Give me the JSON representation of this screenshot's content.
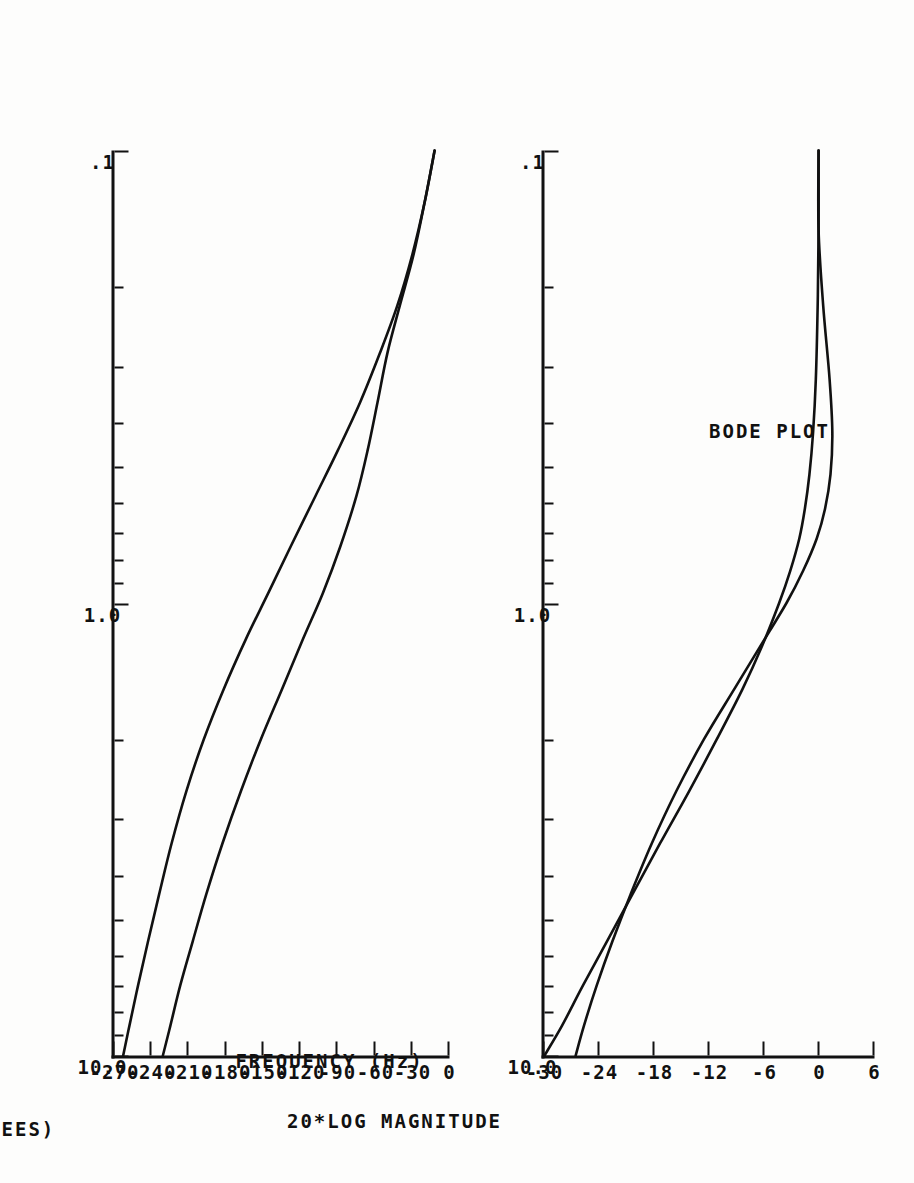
{
  "page": {
    "title": "BODE PLOT",
    "orientation": "rotated-90",
    "background": "#fdfdfc",
    "ink": "#111111"
  },
  "chart_data": [
    {
      "type": "line",
      "id": "magnitude",
      "title": "BODE PLOT",
      "xlabel": "",
      "ylabel": "20*LOG MAGNITUDE",
      "xscale": "log",
      "xlim": [
        0.1,
        10.0
      ],
      "ylim": [
        -30,
        6
      ],
      "xticks": [
        0.1,
        1.0,
        10.0
      ],
      "xticklabels": [
        ".1",
        "1.0",
        "10.0"
      ],
      "yticks": [
        6,
        0,
        -6,
        -12,
        -18,
        -24,
        -30
      ],
      "yticklabels": [
        "6",
        "0",
        "-6",
        "-12",
        "-18",
        "-24",
        "-30"
      ],
      "grid": false,
      "legend": "none",
      "series": [
        {
          "name": "curve-a",
          "x": [
            0.1,
            0.15,
            0.22,
            0.32,
            0.42,
            0.52,
            0.62,
            0.72,
            0.85,
            1.0,
            1.25,
            1.55,
            2.0,
            2.6,
            3.4,
            4.4,
            5.6,
            7.0,
            8.6,
            10.0
          ],
          "y": [
            -0.1,
            -0.1,
            -0.2,
            -0.4,
            -0.7,
            -1.1,
            -1.6,
            -2.2,
            -3.2,
            -4.4,
            -6.3,
            -8.4,
            -11.2,
            -14.2,
            -17.4,
            -20.4,
            -23.2,
            -25.8,
            -28.1,
            -30.0
          ]
        },
        {
          "name": "curve-b",
          "x": [
            0.1,
            0.15,
            0.22,
            0.32,
            0.42,
            0.52,
            0.62,
            0.72,
            0.85,
            1.0,
            1.25,
            1.55,
            2.0,
            2.6,
            3.4,
            4.4,
            5.6,
            7.0,
            8.6,
            10.0
          ],
          "y": [
            -0.1,
            -0.1,
            0.4,
            1.1,
            1.4,
            1.2,
            0.6,
            -0.3,
            -1.8,
            -3.6,
            -6.5,
            -9.3,
            -12.6,
            -15.6,
            -18.3,
            -20.6,
            -22.6,
            -24.3,
            -25.7,
            -26.6
          ]
        }
      ]
    },
    {
      "type": "line",
      "id": "phase",
      "title": "",
      "xlabel": "FREQUENCY  (Hz)",
      "ylabel": "PHASE (DEGREES)",
      "xscale": "log",
      "xlim": [
        0.1,
        10.0
      ],
      "ylim": [
        -270,
        0
      ],
      "xticks": [
        0.1,
        1.0,
        10.0
      ],
      "xticklabels": [
        ".1",
        "1.0",
        "10.0"
      ],
      "yticks": [
        0,
        -30,
        -60,
        -90,
        -120,
        -150,
        -180,
        -210,
        -240,
        -270
      ],
      "yticklabels": [
        "0",
        "-30",
        "-60",
        "-90",
        "-120",
        "-150",
        "-180",
        "-210",
        "-240",
        "-270"
      ],
      "grid": false,
      "legend": "none",
      "series": [
        {
          "name": "curve-a",
          "x": [
            0.1,
            0.13,
            0.17,
            0.22,
            0.28,
            0.36,
            0.46,
            0.58,
            0.75,
            0.95,
            1.2,
            1.55,
            2.0,
            2.6,
            3.4,
            4.4,
            5.6,
            7.0,
            8.6,
            10.0
          ],
          "y": [
            -12,
            -20,
            -30,
            -42,
            -56,
            -72,
            -90,
            -108,
            -128,
            -146,
            -164,
            -182,
            -198,
            -212,
            -224,
            -234,
            -243,
            -251,
            -258,
            -263
          ]
        },
        {
          "name": "curve-b",
          "x": [
            0.1,
            0.13,
            0.17,
            0.22,
            0.28,
            0.36,
            0.46,
            0.58,
            0.75,
            0.95,
            1.2,
            1.55,
            2.0,
            2.6,
            3.4,
            4.4,
            5.6,
            7.0,
            8.6,
            10.0
          ],
          "y": [
            -12,
            -20,
            -29,
            -40,
            -50,
            -58,
            -66,
            -75,
            -88,
            -102,
            -118,
            -135,
            -152,
            -168,
            -183,
            -196,
            -207,
            -217,
            -225,
            -231
          ]
        }
      ]
    }
  ],
  "magnitude_panel": {
    "title": "BODE PLOT",
    "axis_title": "20*LOG MAGNITUDE",
    "yticklabels": [
      "6",
      "0",
      "-6",
      "-12",
      "-18",
      "-24",
      "-30"
    ],
    "xticklabels": [
      ".1",
      "1.0",
      "10.0"
    ]
  },
  "phase_panel": {
    "axis_title": "PHASE (DEGREES)",
    "xaxis_title": "FREQUENCY  (Hz)",
    "yticklabels": [
      "0",
      "-30",
      "-60",
      "-90",
      "-120",
      "-150",
      "-180",
      "-210",
      "-240",
      "-270"
    ],
    "xticklabels": [
      ".1",
      "1.0",
      "10.0"
    ]
  }
}
